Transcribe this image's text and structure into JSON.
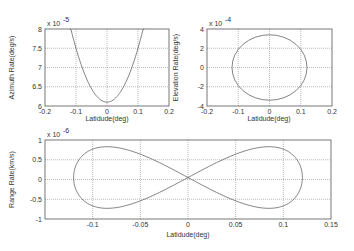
{
  "chart_data": [
    {
      "type": "line",
      "title": "",
      "xlabel": "Latidude(deg)",
      "ylabel": "Azimuth Rate(deg/s)",
      "y_multiplier": "x 10^-5",
      "multiplier_base": "x 10",
      "multiplier_exp": "-5",
      "xlim": [
        -0.2,
        0.2
      ],
      "ylim": [
        6,
        8
      ],
      "xticks": [
        "-0.2",
        "-0.1",
        "0",
        "0.1",
        "0.2"
      ],
      "yticks": [
        "6",
        "6.5",
        "7",
        "7.5",
        "8"
      ],
      "grid": true,
      "series": [
        {
          "name": "azimuth rate",
          "x": [
            -0.12,
            -0.1,
            -0.08,
            -0.06,
            -0.04,
            -0.02,
            0,
            0.02,
            0.04,
            0.06,
            0.08,
            0.1,
            0.12
          ],
          "y": [
            8.0,
            7.5,
            7.05,
            6.65,
            6.35,
            6.16,
            6.1,
            6.16,
            6.35,
            6.65,
            7.05,
            7.5,
            8.0
          ]
        }
      ]
    },
    {
      "type": "line",
      "title": "",
      "xlabel": "Latidude(deg)",
      "ylabel": "Elevation Rate(deg/s)",
      "y_multiplier": "x 10^-4",
      "multiplier_base": "x 10",
      "multiplier_exp": "-4",
      "xlim": [
        -0.2,
        0.2
      ],
      "ylim": [
        -4,
        4
      ],
      "xticks": [
        "-0.2",
        "-0.1",
        "0",
        "0.1",
        "0.2"
      ],
      "yticks": [
        "-4",
        "-2",
        "0",
        "2",
        "4"
      ],
      "grid": true,
      "series": [
        {
          "name": "elevation rate",
          "shape": "closed ellipse",
          "center": [
            0,
            0
          ],
          "x_radius": 0.12,
          "y_radius": 3.4
        }
      ]
    },
    {
      "type": "line",
      "title": "",
      "xlabel": "Latidude(deg)",
      "ylabel": "Range Rate(km/s)",
      "y_multiplier": "x 10^-6",
      "multiplier_base": "x 10",
      "multiplier_exp": "-6",
      "xlim": [
        -0.15,
        0.15
      ],
      "ylim": [
        -1,
        1
      ],
      "xticks": [
        "-0.1",
        "-0.05",
        "0",
        "0.05",
        "0.1",
        "0.15"
      ],
      "yticks": [
        "-1",
        "-0.5",
        "0",
        "0.5",
        "1"
      ],
      "grid": true,
      "series": [
        {
          "name": "range rate",
          "shape": "figure-eight (lemniscate)",
          "x": [
            0,
            0.05,
            0.085,
            0.11,
            0.12,
            0.11,
            0.085,
            0.05,
            0,
            -0.05,
            -0.085,
            -0.11,
            -0.12,
            -0.11,
            -0.085,
            -0.05,
            0
          ],
          "y": [
            0.05,
            0.55,
            0.76,
            0.55,
            0.0,
            -0.4,
            -0.55,
            -0.45,
            0.05,
            0.55,
            0.7,
            0.5,
            0.0,
            -0.55,
            -0.8,
            -0.55,
            0.05
          ]
        }
      ]
    }
  ]
}
